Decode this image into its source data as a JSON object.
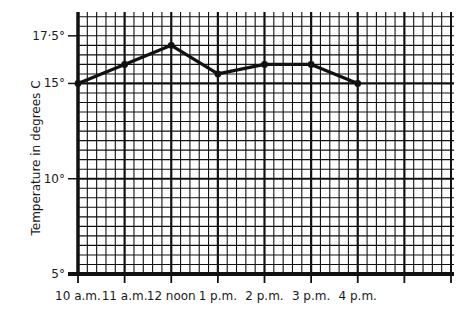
{
  "chart_data": {
    "type": "line",
    "title": "",
    "xlabel": "",
    "ylabel": "Temperature in degrees C",
    "categories": [
      "10 a.m.",
      "11 a.m.",
      "12 noon",
      "1 p.m.",
      "2 p.m.",
      "3 p.m.",
      "4 p.m."
    ],
    "series": [
      {
        "name": "Temperature",
        "values": [
          15.0,
          16.0,
          17.0,
          15.5,
          16.0,
          16.0,
          15.0
        ]
      }
    ],
    "x_slots": 8,
    "ylim": [
      5,
      18.75
    ],
    "y_ticks": [
      {
        "value": 5,
        "label": "5°"
      },
      {
        "value": 10,
        "label": "10°"
      },
      {
        "value": 15,
        "label": "15°"
      },
      {
        "value": 17.5,
        "label": "17·5°"
      }
    ],
    "y_major_lines": [
      5,
      10,
      15
    ],
    "minor_per_major_x": 5,
    "minor_step_y": 0.5,
    "grid": true,
    "legend": "none",
    "colors": {
      "ink": "#111111",
      "background": "#ffffff"
    }
  }
}
